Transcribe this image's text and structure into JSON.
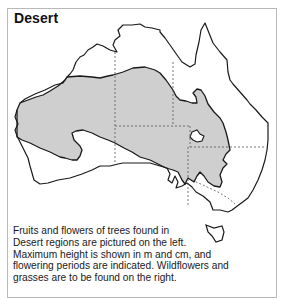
{
  "map": {
    "title": "Desert",
    "region_fill": "#cfcfcf",
    "outline_color": "#1a1a1a",
    "border_color": "#555555",
    "legend_region": "Desert regions (shaded)"
  },
  "caption": {
    "lines": [
      "Fruits and flowers of trees found in",
      "Desert regions are pictured on the left.",
      "Maximum height is shown in m and cm, and",
      "flowering periods are indicated. Wildflowers and",
      "grasses are to be found on the right."
    ]
  }
}
